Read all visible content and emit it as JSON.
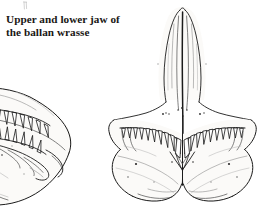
{
  "page": {
    "background_color": "#ffffff",
    "width": 257,
    "height": 206,
    "kind": "book-figure"
  },
  "caption": {
    "line1": "Upper and lower jaw of",
    "line2": "the ballan wrasse",
    "full_text": "Upper and lower jaw of the ballan wrasse",
    "color": "#1a1715"
  },
  "figures": [
    {
      "id": "lateral-jaw",
      "name": "upper-and-lower-jaw-lateral-view",
      "description": "Lateral (side) view of the ballan wrasse upper and lower jaw, cropped at the left edge of the page, showing two opposing rows of conical teeth meeting along the bite line.",
      "cropped_at_left_edge": true,
      "tooth_rows": 2,
      "upper_teeth_count": 9,
      "lower_teeth_count": 9,
      "ink_color": "#1b1b1b"
    },
    {
      "id": "palate-skull",
      "name": "skull-ventral-view",
      "description": "Ventral / palatal view of the ballan wrasse skull showing the elongated tapering rostrum with a central midline suture, the paired tooth-bearing jaw arcs, and the broad flaring lateral wing plates at the base.",
      "has_midline_suture": true,
      "tooth_arcs": 2,
      "teeth_per_arc": 12,
      "ink_color": "#1b1b1b"
    }
  ],
  "colors": {
    "ink_dark": "#1b1b1b",
    "ink_mid": "#4a4a4a",
    "ink_light": "#8d8d8d",
    "ink_faint": "#b6b6b6",
    "bone_fill": "#fbfaf8",
    "paper": "#ffffff"
  }
}
